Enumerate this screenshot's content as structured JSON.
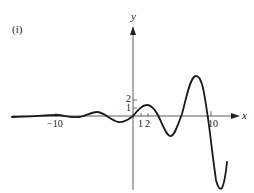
{
  "figure": {
    "panel_label": "(i)",
    "axes": {
      "x_label": "x",
      "y_label": "y",
      "x_ticks": [
        {
          "value": -10,
          "label": "−10"
        },
        {
          "value": 1,
          "label": "1"
        },
        {
          "value": 2,
          "label": "2"
        },
        {
          "value": 10,
          "label": "10"
        }
      ],
      "y_ticks": [
        {
          "value": 1,
          "label": "1"
        },
        {
          "value": 2,
          "label": "2"
        }
      ]
    },
    "colors": {
      "curve": "#1a1a1a",
      "axis": "#333333",
      "background": "#ffffff"
    },
    "curve_description": "Oscillating function with amplitude growing as x increases; nearly flat for large negative x, passes through origin, small local max near x=1.5, min near x=5, large max near x=8, steep descent to deep min near x=11"
  }
}
